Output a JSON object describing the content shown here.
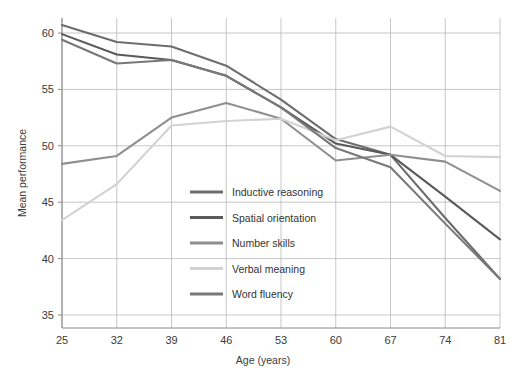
{
  "chart_data": {
    "type": "line",
    "title": "",
    "xlabel": "Age (years)",
    "ylabel": "Mean performance",
    "x": [
      25,
      32,
      39,
      46,
      53,
      60,
      67,
      74,
      81
    ],
    "xticklabels": [
      "25",
      "32",
      "39",
      "46",
      "53",
      "60",
      "67",
      "74",
      "81"
    ],
    "yticklabels": [
      "35",
      "40",
      "45",
      "50",
      "55",
      "60"
    ],
    "yticks": [
      35,
      40,
      45,
      50,
      55,
      60
    ],
    "xlim": [
      25,
      81
    ],
    "ylim": [
      35,
      61.5
    ],
    "grid": true,
    "legend_position": "center-left-inside",
    "series": [
      {
        "name": "Inductive reasoning",
        "color": "#6d6d6d",
        "values": [
          60.7,
          59.2,
          58.8,
          57.1,
          54.1,
          50.6,
          49.2,
          43.6,
          38.2
        ]
      },
      {
        "name": "Spatial orientation",
        "color": "#5a5a5a",
        "values": [
          59.9,
          58.1,
          57.6,
          56.2,
          53.4,
          50.2,
          49.2,
          45.5,
          41.7
        ]
      },
      {
        "name": "Number skills",
        "color": "#8f8f8f",
        "values": [
          48.4,
          49.1,
          52.5,
          53.8,
          52.4,
          48.7,
          49.2,
          48.6,
          46.0
        ]
      },
      {
        "name": "Verbal meaning",
        "color": "#d2d2d2",
        "values": [
          43.4,
          46.6,
          51.8,
          52.2,
          52.4,
          50.5,
          51.7,
          49.1,
          49.0
        ]
      },
      {
        "name": "Word fluency",
        "color": "#787878",
        "values": [
          59.4,
          57.3,
          57.6,
          56.2,
          53.4,
          49.8,
          48.1,
          43.1,
          38.2
        ]
      }
    ]
  },
  "axes": {
    "x_title": "Age (years)",
    "y_title": "Mean performance"
  },
  "legend": {
    "items": [
      {
        "label": "Inductive reasoning"
      },
      {
        "label": "Spatial orientation"
      },
      {
        "label": "Number skills"
      },
      {
        "label": "Verbal meaning"
      },
      {
        "label": "Word fluency"
      }
    ]
  },
  "style": {
    "grid_color": "#b9b9b9",
    "axis_color": "#8a8a8a",
    "background": "#ffffff",
    "text_color": "#3a3a3a"
  }
}
